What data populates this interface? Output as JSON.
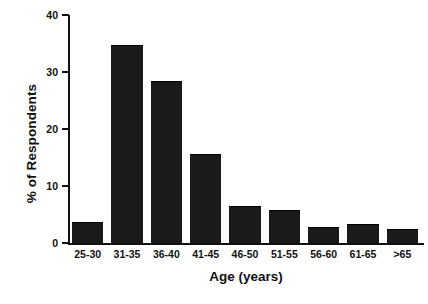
{
  "chart_data": {
    "type": "bar",
    "title": "",
    "xlabel": "Age (years)",
    "ylabel": "% of Respondents",
    "categories": [
      "25-30",
      "31-35",
      "36-40",
      "41-45",
      "46-50",
      "51-55",
      "56-60",
      "61-65",
      ">65"
    ],
    "values": [
      3.5,
      34.5,
      28.3,
      15.5,
      6.3,
      5.6,
      2.6,
      3.2,
      2.2
    ],
    "ylim": [
      0,
      40
    ],
    "yticks": [
      0,
      10,
      20,
      30,
      40
    ],
    "ytick_labels": [
      "0",
      "10",
      "20",
      "30",
      "40"
    ],
    "grid": false,
    "legend": null,
    "bar_color": "#1a1a1a",
    "axis_color": "#111111",
    "background": "#ffffff"
  },
  "axes": {
    "y_title": "% of Respondents",
    "x_title": "Age (years)"
  }
}
